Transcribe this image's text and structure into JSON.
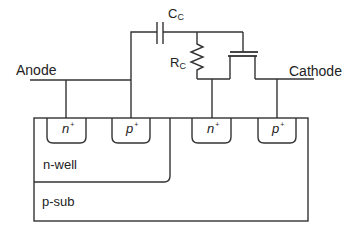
{
  "diagram": {
    "type": "cross-section-with-circuit",
    "terminals": {
      "anode": "Anode",
      "cathode": "Cathode"
    },
    "components": {
      "capacitor": {
        "label": "C",
        "subscript": "C"
      },
      "resistor": {
        "label": "R",
        "subscript": "C"
      },
      "transistor": {
        "kind": "MOSFET"
      }
    },
    "regions": {
      "n_well": "n-well",
      "p_sub": "p-sub"
    },
    "diffusions": [
      {
        "label": "n",
        "sup": "+"
      },
      {
        "label": "p",
        "sup": "+"
      },
      {
        "label": "n",
        "sup": "+"
      },
      {
        "label": "p",
        "sup": "+"
      }
    ],
    "colors": {
      "line": "#333333",
      "text": "#222222",
      "background": "#ffffff"
    }
  }
}
